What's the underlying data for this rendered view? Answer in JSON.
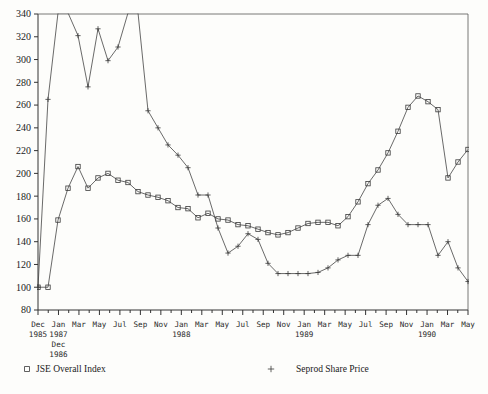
{
  "chart_data": {
    "type": "line",
    "title": "",
    "xlabel": "",
    "ylabel": "",
    "ylim": [
      80,
      340
    ],
    "ytick_step": 20,
    "yticks": [
      80,
      100,
      120,
      140,
      160,
      180,
      200,
      220,
      240,
      260,
      280,
      300,
      320,
      340
    ],
    "grid": false,
    "legend_position": "bottom",
    "x_axis": {
      "tick_labels": [
        "Dec",
        "Jan",
        "Mar",
        "May",
        "Jul",
        "Sep",
        "Nov",
        "Jan",
        "Mar",
        "May",
        "Jul",
        "Sep",
        "Nov",
        "Jan",
        "Mar",
        "May",
        "Jul",
        "Sep",
        "Nov",
        "Jan",
        "Mar",
        "May"
      ],
      "year_labels": [
        {
          "text": "1985",
          "index": 0,
          "row": 1
        },
        {
          "text": "1987",
          "index": 1,
          "row": 1
        },
        {
          "text": "Dec",
          "index": 1,
          "row": 2
        },
        {
          "text": "1986",
          "index": 1,
          "row": 3
        },
        {
          "text": "1988",
          "index": 7,
          "row": 1
        },
        {
          "text": "1989",
          "index": 13,
          "row": 1
        },
        {
          "text": "1990",
          "index": 19,
          "row": 1
        }
      ],
      "minor_ticks_per_major": 2
    },
    "categories": [
      "1985-12",
      "1986-12",
      "1987-01",
      "1987-02",
      "1987-03",
      "1987-04",
      "1987-05",
      "1987-06",
      "1987-07",
      "1987-08",
      "1987-09",
      "1987-10",
      "1987-11",
      "1987-12",
      "1988-01",
      "1988-02",
      "1988-03",
      "1988-04",
      "1988-05",
      "1988-06",
      "1988-07",
      "1988-08",
      "1988-09",
      "1988-10",
      "1988-11",
      "1988-12",
      "1989-01",
      "1989-02",
      "1989-03",
      "1989-04",
      "1989-05",
      "1989-06",
      "1989-07",
      "1989-08",
      "1989-09",
      "1989-10",
      "1989-11",
      "1989-12",
      "1990-01",
      "1990-02",
      "1990-03",
      "1990-04",
      "1990-05",
      "1990-06"
    ],
    "series": [
      {
        "name": "JSE Overall Index",
        "marker": "square",
        "values": [
          100,
          100,
          159,
          187,
          206,
          187,
          196,
          200,
          194,
          192,
          184,
          181,
          179,
          176,
          170,
          169,
          161,
          165,
          160,
          159,
          155,
          154,
          151,
          148,
          146,
          148,
          152,
          156,
          157,
          157,
          154,
          162,
          175,
          191,
          203,
          218,
          237,
          258,
          268,
          263,
          256,
          196,
          210,
          221
        ]
      },
      {
        "name": "Seprod Share Price",
        "marker": "plus",
        "values": [
          100,
          265,
          341,
          341,
          321,
          276,
          327,
          299,
          311,
          341,
          341,
          255,
          240,
          225,
          216,
          205,
          181,
          181,
          152,
          130,
          136,
          147,
          142,
          121,
          112,
          112,
          112,
          112,
          113,
          117,
          124,
          128,
          128,
          155,
          172,
          178,
          164,
          155,
          155,
          155,
          128,
          140,
          117,
          105
        ]
      }
    ],
    "annotations": []
  },
  "legend": {
    "entries": [
      {
        "label": "JSE Overall Index",
        "marker": "square"
      },
      {
        "label": "Seprod Share Price",
        "marker": "plus"
      }
    ]
  }
}
